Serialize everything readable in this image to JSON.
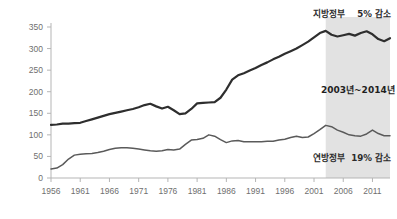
{
  "chart_data": {
    "type": "line",
    "title": "",
    "subtitle": "",
    "xlabel": "",
    "ylabel": "",
    "xlim": [
      1956,
      2014
    ],
    "ylim": [
      0,
      350
    ],
    "grid": false,
    "legend_position": "inline-annotation",
    "x_ticks": [
      "1956",
      "1961",
      "1966",
      "1971",
      "1976",
      "1981",
      "1986",
      "1991",
      "1996",
      "2001",
      "2006",
      "2011"
    ],
    "y_ticks": [
      "0",
      "50",
      "100",
      "150",
      "200",
      "250",
      "300",
      "350"
    ],
    "x": [
      1956,
      1957,
      1958,
      1959,
      1960,
      1961,
      1962,
      1963,
      1964,
      1965,
      1966,
      1967,
      1968,
      1969,
      1970,
      1971,
      1972,
      1973,
      1974,
      1975,
      1976,
      1977,
      1978,
      1979,
      1980,
      1981,
      1982,
      1983,
      1984,
      1985,
      1986,
      1987,
      1988,
      1989,
      1990,
      1991,
      1992,
      1993,
      1994,
      1995,
      1996,
      1997,
      1998,
      1999,
      2000,
      2001,
      2002,
      2003,
      2004,
      2005,
      2006,
      2007,
      2008,
      2009,
      2010,
      2011,
      2012,
      2013,
      2014
    ],
    "series": [
      {
        "name": "지방정부",
        "color": "#2e2e2e",
        "width": 2.2,
        "values": [
          123,
          124,
          126,
          126,
          127,
          128,
          132,
          136,
          140,
          144,
          148,
          151,
          154,
          157,
          160,
          164,
          169,
          172,
          166,
          161,
          165,
          157,
          148,
          150,
          160,
          173,
          174,
          175,
          176,
          186,
          205,
          228,
          238,
          243,
          249,
          255,
          262,
          268,
          275,
          281,
          288,
          294,
          300,
          308,
          316,
          326,
          336,
          341,
          332,
          328,
          331,
          334,
          330,
          336,
          340,
          333,
          322,
          317,
          324
        ]
      },
      {
        "name": "연방정부",
        "color": "#5a5a5a",
        "width": 1.5,
        "values": [
          21,
          23,
          31,
          44,
          53,
          55,
          56,
          57,
          59,
          62,
          66,
          69,
          70,
          70,
          69,
          67,
          65,
          63,
          62,
          63,
          66,
          65,
          67,
          78,
          88,
          89,
          92,
          100,
          97,
          89,
          82,
          86,
          87,
          84,
          84,
          84,
          84,
          85,
          85,
          88,
          90,
          94,
          97,
          94,
          95,
          103,
          112,
          122,
          119,
          111,
          106,
          100,
          98,
          97,
          102,
          111,
          103,
          98,
          98
        ]
      }
    ],
    "highlight_band": {
      "label": "2003년~2014년",
      "start": 2003,
      "end": 2014,
      "fill": "#e2e2e2"
    },
    "annotations": [
      {
        "name": "지방정부",
        "change": "5% 감소",
        "position": "top-right"
      },
      {
        "name": "연방정부",
        "change": "19% 감소",
        "position": "bottom-right"
      }
    ]
  },
  "labels": {
    "local_gov": "지방정부",
    "local_gov_change": "5% 감소",
    "federal_gov": "연방정부",
    "federal_gov_change": "19% 감소",
    "band_label": "2003년~2014년"
  },
  "colors": {
    "local_line": "#2e2e2e",
    "federal_line": "#5a5a5a",
    "band": "#e2e2e2",
    "axis": "#b5b5b5",
    "tick_text": "#6f6f6f"
  }
}
